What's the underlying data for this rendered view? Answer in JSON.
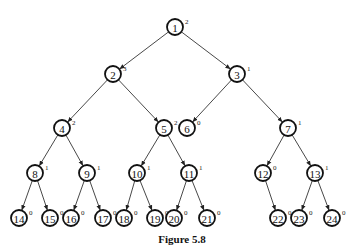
{
  "caption": "Figure 5.8",
  "nodes": [
    {
      "id": "1",
      "x": 175,
      "y": 27,
      "sup": "2"
    },
    {
      "id": "2",
      "x": 113,
      "y": 74,
      "sup": "3"
    },
    {
      "id": "3",
      "x": 237,
      "y": 74,
      "sup": "1"
    },
    {
      "id": "4",
      "x": 62,
      "y": 128,
      "sup": "2"
    },
    {
      "id": "5",
      "x": 164,
      "y": 128,
      "sup": "2"
    },
    {
      "id": "6",
      "x": 187,
      "y": 128,
      "sup": "0"
    },
    {
      "id": "7",
      "x": 288,
      "y": 128,
      "sup": "1"
    },
    {
      "id": "8",
      "x": 35,
      "y": 173,
      "sup": "1"
    },
    {
      "id": "9",
      "x": 87,
      "y": 173,
      "sup": "1"
    },
    {
      "id": "10",
      "x": 137,
      "y": 173,
      "sup": "1"
    },
    {
      "id": "11",
      "x": 189,
      "y": 173,
      "sup": "1"
    },
    {
      "id": "12",
      "x": 263,
      "y": 173,
      "sup": "0"
    },
    {
      "id": "13",
      "x": 315,
      "y": 173,
      "sup": "1"
    },
    {
      "id": "14",
      "x": 19,
      "y": 218,
      "sup": "0"
    },
    {
      "id": "15",
      "x": 50,
      "y": 218,
      "sup": "0"
    },
    {
      "id": "16",
      "x": 71,
      "y": 218,
      "sup": "0"
    },
    {
      "id": "17",
      "x": 103,
      "y": 218,
      "sup": "0"
    },
    {
      "id": "18",
      "x": 124,
      "y": 218,
      "sup": "0"
    },
    {
      "id": "19",
      "x": 155,
      "y": 218,
      "sup": "0"
    },
    {
      "id": "20",
      "x": 174,
      "y": 218,
      "sup": "0"
    },
    {
      "id": "21",
      "x": 207,
      "y": 218,
      "sup": "0"
    },
    {
      "id": "22",
      "x": 278,
      "y": 218,
      "sup": "0"
    },
    {
      "id": "23",
      "x": 299,
      "y": 218,
      "sup": "0"
    },
    {
      "id": "24",
      "x": 332,
      "y": 218,
      "sup": "0"
    }
  ],
  "edges": [
    [
      "1",
      "2"
    ],
    [
      "1",
      "3"
    ],
    [
      "2",
      "4"
    ],
    [
      "2",
      "5"
    ],
    [
      "3",
      "6"
    ],
    [
      "3",
      "7"
    ],
    [
      "4",
      "8"
    ],
    [
      "4",
      "9"
    ],
    [
      "5",
      "10"
    ],
    [
      "5",
      "11"
    ],
    [
      "7",
      "12"
    ],
    [
      "7",
      "13"
    ],
    [
      "8",
      "14"
    ],
    [
      "8",
      "15"
    ],
    [
      "9",
      "16"
    ],
    [
      "9",
      "17"
    ],
    [
      "10",
      "18"
    ],
    [
      "10",
      "19"
    ],
    [
      "11",
      "20"
    ],
    [
      "11",
      "21"
    ],
    [
      "12",
      "22"
    ],
    [
      "13",
      "23"
    ],
    [
      "13",
      "24"
    ]
  ]
}
